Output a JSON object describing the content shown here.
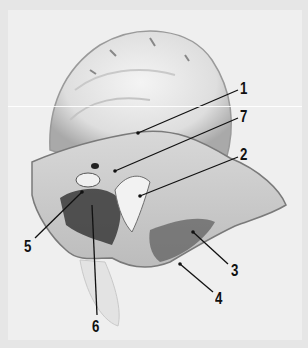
{
  "figure": {
    "background_color": "#efefef",
    "labels": [
      {
        "id": "1",
        "text": "1",
        "x": 240,
        "y": 80,
        "line": [
          138,
          133,
          238,
          90
        ]
      },
      {
        "id": "7",
        "text": "7",
        "x": 240,
        "y": 108,
        "line": [
          115,
          171,
          238,
          118
        ]
      },
      {
        "id": "2",
        "text": "2",
        "x": 240,
        "y": 146,
        "line": [
          140,
          196,
          238,
          157
        ]
      },
      {
        "id": "5",
        "text": "5",
        "x": 24,
        "y": 238,
        "line": [
          82,
          192,
          35,
          238
        ]
      },
      {
        "id": "6",
        "text": "6",
        "x": 92,
        "y": 318,
        "line": [
          92,
          205,
          97,
          315
        ]
      },
      {
        "id": "3",
        "text": "3",
        "x": 231,
        "y": 262,
        "line": [
          193,
          232,
          228,
          264
        ]
      },
      {
        "id": "4",
        "text": "4",
        "x": 215,
        "y": 290,
        "line": [
          180,
          264,
          213,
          292
        ]
      }
    ]
  }
}
